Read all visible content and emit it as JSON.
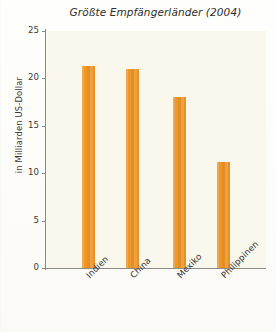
{
  "chart_data": {
    "type": "bar",
    "title": "Größte Empfängerländer (2004)",
    "xlabel": "",
    "ylabel": "in Milliarden US-Dollar",
    "categories": [
      "Indien",
      "China",
      "Mexiko",
      "Philippinen"
    ],
    "values": [
      21.3,
      21.0,
      18.0,
      11.2
    ],
    "ylim": [
      0,
      25
    ],
    "yticks": [
      "0",
      "5",
      "10",
      "15",
      "20",
      "25"
    ],
    "ytick_values": [
      0,
      5,
      10,
      15,
      20,
      25
    ],
    "grid": false,
    "legend": "none",
    "bar_color": "#ee9628",
    "plot_background": "#faf7ec",
    "axis_color": "#8c8a86",
    "text_color": "#33312d"
  }
}
